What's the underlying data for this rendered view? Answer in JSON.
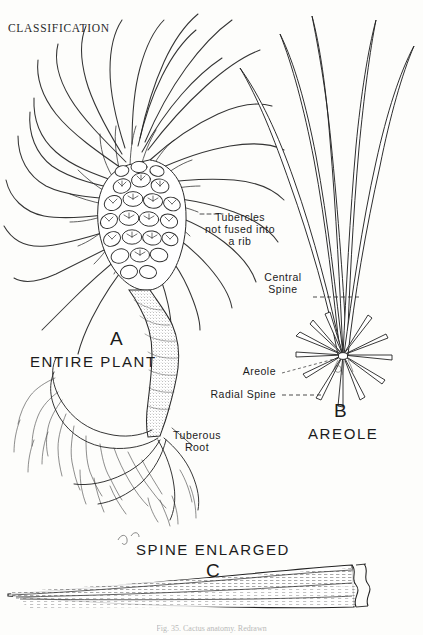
{
  "page": {
    "running_head": "CLASSIFICATION",
    "background_color": "#fdfdfb",
    "ink_color": "#1b1b1b",
    "width": 423,
    "height": 635
  },
  "figure": {
    "caption_clipped": "Fig. 35. Cactus anatomy. Redrawn",
    "panels": [
      {
        "key": "A",
        "letter": "A",
        "title": "ENTIRE PLANT",
        "letter_x": 110,
        "letter_y": 340,
        "title_x": 88,
        "title_y": 364
      },
      {
        "key": "B",
        "letter": "B",
        "title": "AREOLE",
        "letter_x": 340,
        "letter_y": 412,
        "title_x": 345,
        "title_y": 436
      },
      {
        "key": "C",
        "letter": "C",
        "title": "SPINE ENLARGED",
        "letter_x": 213,
        "letter_y": 570,
        "title_x": 213,
        "title_y": 551
      }
    ],
    "annotations": [
      {
        "name": "tubercles",
        "lines": [
          "Tubercles",
          "not fused into",
          "a rib"
        ],
        "x": 240,
        "y": 219,
        "align": "center",
        "leader": "dash-left"
      },
      {
        "name": "central-spine",
        "lines": [
          "Central",
          "Spine"
        ],
        "x": 283,
        "y": 279,
        "align": "center",
        "leader": "dash-right"
      },
      {
        "name": "areole",
        "lines": [
          "Areole"
        ],
        "x": 276,
        "y": 371,
        "align": "right",
        "leader": "dash-right"
      },
      {
        "name": "radial-spine",
        "lines": [
          "Radial Spine"
        ],
        "x": 276,
        "y": 394,
        "align": "right",
        "leader": "dash-right"
      },
      {
        "name": "tuberous-root",
        "lines": [
          "Tuberous",
          "Root"
        ],
        "x": 197,
        "y": 437,
        "align": "center",
        "leader": "thin-up-left"
      }
    ]
  }
}
